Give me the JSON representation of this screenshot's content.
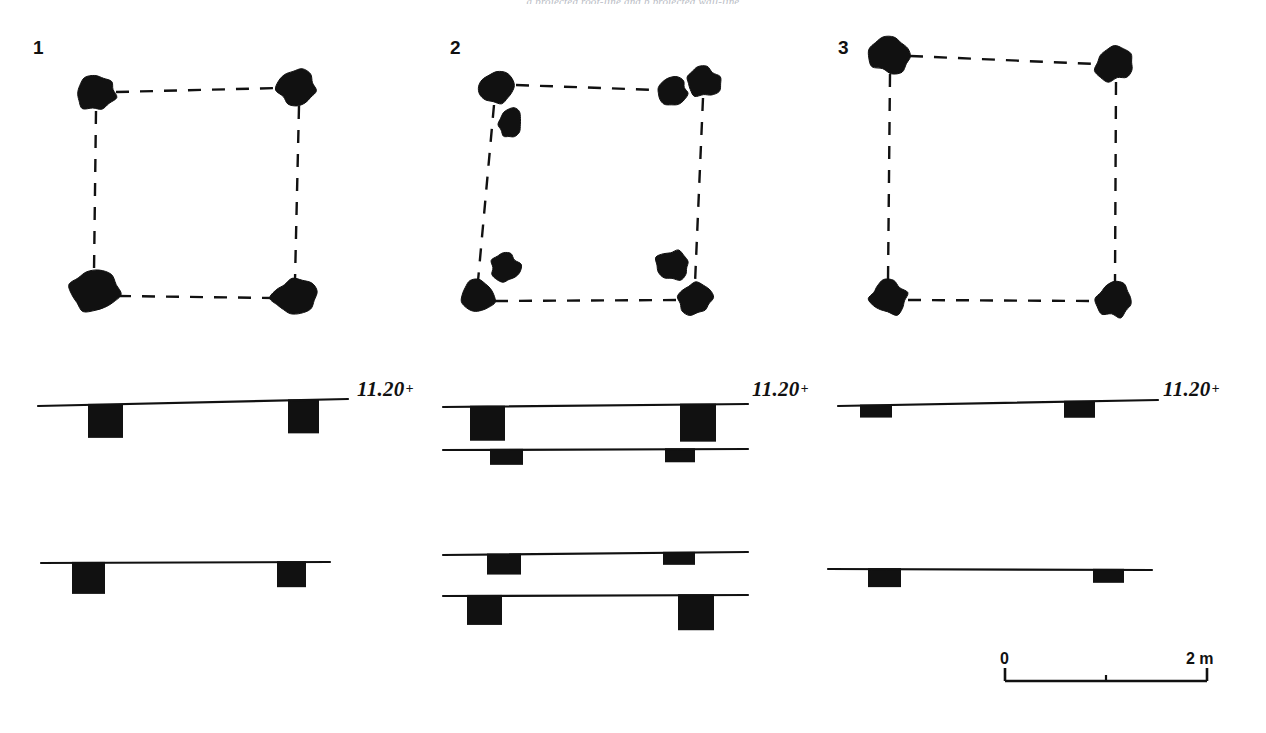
{
  "figure": {
    "caption_fragment": "a projected roof-line     and b projected wall-line",
    "background_color": "#ffffff",
    "ink_color": "#111111"
  },
  "panels": [
    {
      "id": "panel-1",
      "number": "1",
      "number_pos": {
        "x": 33,
        "y": 38
      },
      "plan": {
        "postholes": [
          {
            "name": "posthole-nw",
            "cx": 96,
            "cy": 93,
            "rx": 20,
            "ry": 17,
            "rot": -12,
            "seed": 3
          },
          {
            "name": "posthole-ne",
            "cx": 297,
            "cy": 88,
            "rx": 20,
            "ry": 19,
            "rot": 8,
            "seed": 7
          },
          {
            "name": "posthole-sw",
            "cx": 94,
            "cy": 292,
            "rx": 25,
            "ry": 21,
            "rot": 5,
            "seed": 11
          },
          {
            "name": "posthole-se",
            "cx": 294,
            "cy": 297,
            "rx": 22,
            "ry": 18,
            "rot": -14,
            "seed": 5
          }
        ],
        "links": [
          {
            "name": "link-top",
            "x1": 116,
            "y1": 92,
            "x2": 279,
            "y2": 88
          },
          {
            "name": "link-right",
            "x1": 299,
            "y1": 106,
            "x2": 295,
            "y2": 280
          },
          {
            "name": "link-bottom",
            "x1": 118,
            "y1": 296,
            "x2": 274,
            "y2": 298
          },
          {
            "name": "link-left",
            "x1": 96,
            "y1": 111,
            "x2": 94,
            "y2": 272
          }
        ]
      },
      "sections": [
        {
          "name": "section-upper-a",
          "ground_line": {
            "x1": 38,
            "y1": 406,
            "x2": 348,
            "y2": 399
          },
          "level_label": {
            "text": "11.20",
            "plus": "+",
            "x": 357,
            "y": 379
          },
          "cuts": [
            {
              "name": "cut-left",
              "x": 88,
              "y": 406,
              "w": 35,
              "h": 33
            },
            {
              "name": "cut-right",
              "x": 288,
              "y": 401,
              "w": 31,
              "h": 33
            }
          ]
        },
        {
          "name": "section-lower-a",
          "ground_line": {
            "x1": 41,
            "y1": 563,
            "x2": 330,
            "y2": 562
          },
          "level_label": null,
          "cuts": [
            {
              "name": "cut-left",
              "x": 72,
              "y": 563,
              "w": 33,
              "h": 31
            },
            {
              "name": "cut-right",
              "x": 277,
              "y": 562,
              "w": 29,
              "h": 25
            }
          ]
        }
      ]
    },
    {
      "id": "panel-2",
      "number": "2",
      "number_pos": {
        "x": 450,
        "y": 38
      },
      "plan": {
        "postholes": [
          {
            "name": "posthole-nw-main",
            "cx": 497,
            "cy": 88,
            "rx": 19,
            "ry": 16,
            "rot": -8,
            "seed": 2
          },
          {
            "name": "posthole-nw-extra",
            "cx": 510,
            "cy": 123,
            "rx": 12,
            "ry": 15,
            "rot": 10,
            "seed": 9
          },
          {
            "name": "posthole-ne-inner",
            "cx": 672,
            "cy": 92,
            "rx": 16,
            "ry": 14,
            "rot": -20,
            "seed": 4
          },
          {
            "name": "posthole-ne-outer",
            "cx": 703,
            "cy": 82,
            "rx": 18,
            "ry": 15,
            "rot": 6,
            "seed": 13
          },
          {
            "name": "posthole-sw-upper",
            "cx": 505,
            "cy": 268,
            "rx": 15,
            "ry": 15,
            "rot": 15,
            "seed": 6
          },
          {
            "name": "posthole-sw-lower",
            "cx": 478,
            "cy": 296,
            "rx": 17,
            "ry": 16,
            "rot": -6,
            "seed": 8
          },
          {
            "name": "posthole-se-upper",
            "cx": 673,
            "cy": 265,
            "rx": 17,
            "ry": 15,
            "rot": 12,
            "seed": 10
          },
          {
            "name": "posthole-se-lower",
            "cx": 695,
            "cy": 299,
            "rx": 18,
            "ry": 16,
            "rot": -5,
            "seed": 12
          }
        ],
        "links": [
          {
            "name": "link-top",
            "x1": 516,
            "y1": 85,
            "x2": 657,
            "y2": 90
          },
          {
            "name": "link-right",
            "x1": 703,
            "y1": 98,
            "x2": 695,
            "y2": 283
          },
          {
            "name": "link-bottom",
            "x1": 495,
            "y1": 301,
            "x2": 678,
            "y2": 300
          },
          {
            "name": "link-left",
            "x1": 494,
            "y1": 105,
            "x2": 478,
            "y2": 281
          }
        ]
      },
      "sections": [
        {
          "name": "section-upper-a",
          "ground_line": {
            "x1": 443,
            "y1": 407,
            "x2": 748,
            "y2": 404
          },
          "level_label": {
            "text": "11.20",
            "plus": "+",
            "x": 752,
            "y": 379
          },
          "cuts": [
            {
              "name": "cut-left",
              "x": 470,
              "y": 407,
              "w": 35,
              "h": 34
            },
            {
              "name": "cut-right",
              "x": 680,
              "y": 405,
              "w": 36,
              "h": 37
            }
          ]
        },
        {
          "name": "section-upper-b",
          "ground_line": {
            "x1": 443,
            "y1": 450,
            "x2": 748,
            "y2": 449
          },
          "level_label": null,
          "cuts": [
            {
              "name": "cut-left",
              "x": 490,
              "y": 450,
              "w": 33,
              "h": 15
            },
            {
              "name": "cut-right",
              "x": 665,
              "y": 449,
              "w": 30,
              "h": 13
            }
          ]
        },
        {
          "name": "section-lower-a",
          "ground_line": {
            "x1": 443,
            "y1": 555,
            "x2": 748,
            "y2": 552
          },
          "level_label": null,
          "cuts": [
            {
              "name": "cut-left",
              "x": 487,
              "y": 555,
              "w": 34,
              "h": 20
            },
            {
              "name": "cut-right",
              "x": 663,
              "y": 552,
              "w": 32,
              "h": 12
            }
          ]
        },
        {
          "name": "section-lower-b",
          "ground_line": {
            "x1": 443,
            "y1": 596,
            "x2": 748,
            "y2": 595
          },
          "level_label": null,
          "cuts": [
            {
              "name": "cut-left",
              "x": 467,
              "y": 596,
              "w": 35,
              "h": 29
            },
            {
              "name": "cut-right",
              "x": 678,
              "y": 595,
              "w": 36,
              "h": 35
            }
          ]
        }
      ]
    },
    {
      "id": "panel-3",
      "number": "3",
      "number_pos": {
        "x": 838,
        "y": 38
      },
      "plan": {
        "postholes": [
          {
            "name": "posthole-nw",
            "cx": 890,
            "cy": 55,
            "rx": 21,
            "ry": 18,
            "rot": 4,
            "seed": 1
          },
          {
            "name": "posthole-ne",
            "cx": 1114,
            "cy": 64,
            "rx": 19,
            "ry": 17,
            "rot": -6,
            "seed": 14
          },
          {
            "name": "posthole-sw",
            "cx": 888,
            "cy": 298,
            "rx": 19,
            "ry": 17,
            "rot": 10,
            "seed": 15
          },
          {
            "name": "posthole-se",
            "cx": 1115,
            "cy": 300,
            "rx": 19,
            "ry": 17,
            "rot": -9,
            "seed": 16
          }
        ],
        "links": [
          {
            "name": "link-top",
            "x1": 910,
            "y1": 56,
            "x2": 1095,
            "y2": 64
          },
          {
            "name": "link-right",
            "x1": 1116,
            "y1": 82,
            "x2": 1115,
            "y2": 283
          },
          {
            "name": "link-bottom",
            "x1": 908,
            "y1": 300,
            "x2": 1096,
            "y2": 301
          },
          {
            "name": "link-left",
            "x1": 890,
            "y1": 74,
            "x2": 888,
            "y2": 281
          }
        ]
      },
      "sections": [
        {
          "name": "section-upper-a",
          "ground_line": {
            "x1": 838,
            "y1": 406,
            "x2": 1158,
            "y2": 400
          },
          "level_label": {
            "text": "11.20",
            "plus": "+",
            "x": 1163,
            "y": 379
          },
          "cuts": [
            {
              "name": "cut-left",
              "x": 860,
              "y": 406,
              "w": 32,
              "h": 12
            },
            {
              "name": "cut-right",
              "x": 1064,
              "y": 402,
              "w": 31,
              "h": 16
            }
          ]
        },
        {
          "name": "section-lower-a",
          "ground_line": {
            "x1": 828,
            "y1": 569,
            "x2": 1152,
            "y2": 570
          },
          "level_label": null,
          "cuts": [
            {
              "name": "cut-left",
              "x": 868,
              "y": 570,
              "w": 33,
              "h": 18
            },
            {
              "name": "cut-right",
              "x": 1093,
              "y": 570,
              "w": 31,
              "h": 13
            }
          ]
        }
      ]
    }
  ],
  "scale_bar": {
    "name": "scale-bar",
    "start_label": "0",
    "end_label": "2 m",
    "x1": 1005,
    "x2": 1207,
    "y": 681,
    "tick_height": 13,
    "mid_tick_height": 6,
    "start_label_pos": {
      "x": 1000,
      "y": 651
    },
    "end_label_pos": {
      "x": 1186,
      "y": 651
    }
  }
}
